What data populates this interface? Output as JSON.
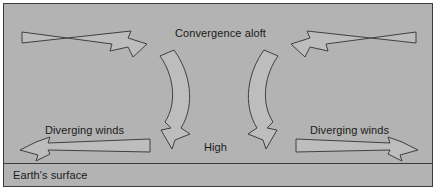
{
  "figure": {
    "type": "meteorological-diagram",
    "panel_background_color": "#b3b3b3",
    "border_color": "#3c3c3c",
    "text_color": "#1a1a1a",
    "arrow_fill_color": "#bdbdbd",
    "arrow_outline_color": "#404040"
  },
  "labels": {
    "convergence_aloft": "Convergence aloft",
    "high": "High",
    "diverging_winds_left": "Diverging winds",
    "diverging_winds_right": "Diverging winds",
    "earth_surface": "Earth's surface"
  },
  "arrows": [
    {
      "name": "converging-arrow-top-left",
      "direction": "right-and-down",
      "style": "straight-tapered-swallowtail",
      "meaning": "air converging aloft from the left"
    },
    {
      "name": "converging-arrow-top-right",
      "direction": "left-and-down",
      "style": "straight-tapered-swallowtail",
      "meaning": "air converging aloft from the right"
    },
    {
      "name": "subsiding-arrow-left",
      "direction": "curved-downward",
      "style": "curved-ribbon",
      "meaning": "sinking air descending toward the surface"
    },
    {
      "name": "subsiding-arrow-right",
      "direction": "curved-downward",
      "style": "curved-ribbon",
      "meaning": "sinking air descending toward the surface"
    },
    {
      "name": "diverging-arrow-left",
      "direction": "left",
      "style": "straight-tapered-swallowtail",
      "meaning": "surface winds diverging to the left"
    },
    {
      "name": "diverging-arrow-right",
      "direction": "right",
      "style": "straight-tapered-swallowtail",
      "meaning": "surface winds diverging to the right"
    }
  ]
}
